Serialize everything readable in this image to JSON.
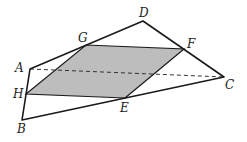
{
  "diagram": {
    "colors": {
      "stroke": "#1a1a1a",
      "fill": "#bdbdbd",
      "dashed": "#333333"
    },
    "points": {
      "A": {
        "label": "A",
        "x": 30,
        "y": 69
      },
      "B": {
        "label": "B",
        "x": 22,
        "y": 120
      },
      "C": {
        "label": "C",
        "x": 224,
        "y": 77
      },
      "D": {
        "label": "D",
        "x": 143,
        "y": 21
      },
      "E": {
        "label": "E",
        "x": 125,
        "y": 98
      },
      "F": {
        "label": "F",
        "x": 184,
        "y": 49
      },
      "G": {
        "label": "G",
        "x": 86,
        "y": 45
      },
      "H": {
        "label": "H",
        "x": 26,
        "y": 94
      }
    },
    "labels": {
      "A": "A",
      "B": "B",
      "C": "C",
      "D": "D",
      "E": "E",
      "F": "F",
      "G": "G",
      "H": "H"
    },
    "segments_solid": [
      "AB",
      "BC",
      "CD",
      "DA",
      "EF",
      "FG",
      "GH",
      "HE"
    ],
    "segments_dashed": [
      "AC"
    ],
    "shaded_polygon": [
      "E",
      "F",
      "G",
      "H"
    ]
  }
}
